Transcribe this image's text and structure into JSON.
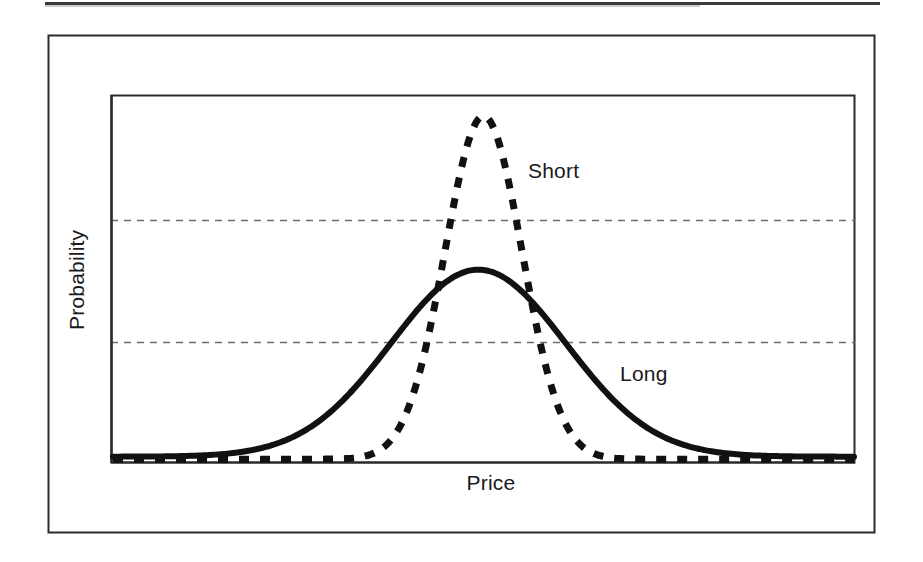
{
  "figure": {
    "width": 923,
    "height": 562,
    "background": "#ffffff",
    "top_rule": {
      "present": true,
      "color": "#3a3a3a"
    },
    "outer_frame": {
      "present": true,
      "color": "#2b2b2b"
    }
  },
  "chart_data": {
    "type": "line",
    "title": "",
    "subtitle": "",
    "xlabel": "Price",
    "ylabel": "Probability",
    "grid": true,
    "grid_style": "dotted-horizontal",
    "grid_values": [
      0.33,
      0.67
    ],
    "legend_position": "inline-annotation",
    "axis_tick_labels": {
      "x": [],
      "y": []
    },
    "xlim": [
      0,
      1
    ],
    "ylim": [
      0,
      1
    ],
    "series": [
      {
        "name": "Short",
        "style": "dashed",
        "color": "#111111",
        "linewidth": 7,
        "description": "Narrow, tall probability distribution centred on Price",
        "peak_x": 0.5,
        "peak_y": 0.955,
        "sigma": 0.052,
        "x": [
          0.0,
          0.05,
          0.1,
          0.15,
          0.2,
          0.25,
          0.3,
          0.33,
          0.36,
          0.39,
          0.42,
          0.45,
          0.47,
          0.5,
          0.53,
          0.55,
          0.58,
          0.61,
          0.64,
          0.67,
          0.7,
          0.75,
          0.8,
          0.85,
          0.9,
          0.95,
          1.0
        ],
        "y": [
          0.005,
          0.006,
          0.007,
          0.009,
          0.012,
          0.018,
          0.035,
          0.06,
          0.115,
          0.215,
          0.4,
          0.66,
          0.835,
          0.955,
          0.84,
          0.7,
          0.43,
          0.23,
          0.115,
          0.06,
          0.035,
          0.018,
          0.011,
          0.008,
          0.006,
          0.005,
          0.005
        ],
        "label_text": "Short",
        "label_x": 0.6,
        "label_y": 0.795
      },
      {
        "name": "Long",
        "style": "solid",
        "color": "#111111",
        "linewidth": 6,
        "description": "Broad, flatter probability distribution centred on Price",
        "peak_x": 0.493,
        "peak_y": 0.53,
        "sigma": 0.118,
        "x": [
          0.0,
          0.05,
          0.1,
          0.15,
          0.2,
          0.25,
          0.3,
          0.33,
          0.36,
          0.39,
          0.42,
          0.45,
          0.47,
          0.493,
          0.52,
          0.55,
          0.58,
          0.61,
          0.64,
          0.67,
          0.7,
          0.75,
          0.8,
          0.85,
          0.9,
          0.95,
          1.0
        ],
        "y": [
          0.012,
          0.018,
          0.03,
          0.05,
          0.082,
          0.132,
          0.215,
          0.275,
          0.34,
          0.405,
          0.462,
          0.505,
          0.522,
          0.53,
          0.52,
          0.49,
          0.435,
          0.365,
          0.29,
          0.22,
          0.16,
          0.085,
          0.045,
          0.025,
          0.016,
          0.012,
          0.01
        ],
        "label_text": "Long",
        "label_x": 0.722,
        "label_y": 0.248
      }
    ],
    "annotations": [
      {
        "text": "Short",
        "x": 0.6,
        "y": 0.795
      },
      {
        "text": "Long",
        "x": 0.722,
        "y": 0.248
      }
    ]
  },
  "labels": {
    "y_axis": "Probability",
    "x_axis": "Price",
    "short": "Short",
    "long": "Long"
  },
  "colors": {
    "ink": "#111111",
    "frame": "#2b2b2b",
    "grid": "#6d6d6d",
    "background": "#ffffff"
  }
}
